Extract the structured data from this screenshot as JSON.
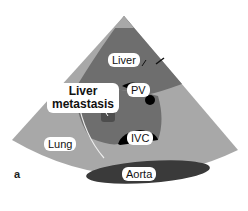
{
  "labels": {
    "liver": "Liver",
    "pv": "PV",
    "liver_metastasis_line1": "Liver",
    "liver_metastasis_line2": "metastasis",
    "ivc": "IVC",
    "lung": "Lung",
    "aorta": "Aorta",
    "figure_letter": "a"
  },
  "colors": {
    "lung_light_gray": "#a6a6a6",
    "liver_dark_gray": "#6b6b6b",
    "aorta_dark": "#3a3a3a",
    "vessel_black": "#000000",
    "lesion": "#4a4a4a"
  }
}
